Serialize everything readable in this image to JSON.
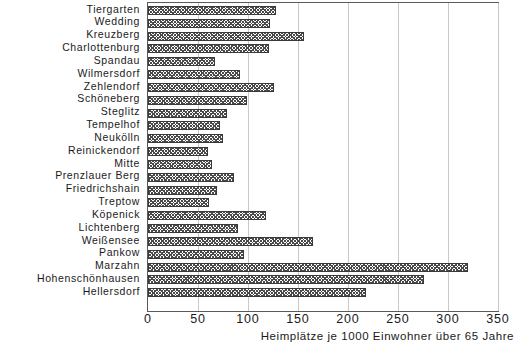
{
  "chart_data": {
    "type": "bar",
    "orientation": "horizontal",
    "title": "",
    "subtitle": "",
    "xlabel": "Heimplätze je 1000 Einwohner über 65 Jahre",
    "ylabel": "",
    "xlim": [
      0,
      350
    ],
    "xticks": [
      0,
      50,
      100,
      150,
      200,
      250,
      300,
      350
    ],
    "xtick_labels": [
      "0",
      "50",
      "100",
      "150",
      "200",
      "250",
      "300",
      "350"
    ],
    "grid": "vertical",
    "legend": "none",
    "series_name": "Heimplätze je 1000 Einwohner über 65 Jahre",
    "categories": [
      "Tiergarten",
      "Wedding",
      "Kreuzberg",
      "Charlottenburg",
      "Spandau",
      "Wilmersdorf",
      "Zehlendorf",
      "Schöneberg",
      "Steglitz",
      "Tempelhof",
      "Neukölln",
      "Reinickendorf",
      "Mitte",
      "Prenzlauer Berg",
      "Friedrichshain",
      "Treptow",
      "Köpenick",
      "Lichtenberg",
      "Weißensee",
      "Pankow",
      "Marzahn",
      "Hohenschönhausen",
      "Hellersdorf"
    ],
    "values": [
      128,
      122,
      156,
      121,
      67,
      92,
      126,
      99,
      79,
      72,
      75,
      60,
      64,
      86,
      69,
      61,
      118,
      90,
      165,
      96,
      320,
      276,
      218
    ]
  },
  "style": {
    "bar_edge_color": "#3a3a3a",
    "bar_hatch_color": "#4a4a4a",
    "grid_color": "#c8c8c8",
    "frame_color": "#5a5a5a",
    "text_color": "#1a1a1a",
    "background": "#ffffff"
  }
}
